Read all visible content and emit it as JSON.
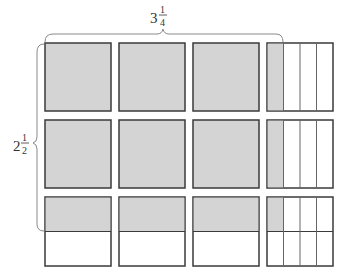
{
  "diagram": {
    "type": "area-model",
    "width_label": {
      "whole": "3",
      "numerator": "1",
      "denominator": "4"
    },
    "height_label": {
      "whole": "2",
      "numerator": "1",
      "denominator": "2"
    },
    "colors": {
      "shaded": "#d4d4d4",
      "unshaded": "#ffffff",
      "border": "#3a3a3a",
      "brace": "#8a8a8a"
    },
    "grid": {
      "columns": 4,
      "rows": 3,
      "column_x": [
        45,
        119,
        193,
        267
      ],
      "row_y": [
        43,
        120,
        197
      ],
      "cell_size": 66,
      "last_column_subdivisions": 4,
      "last_row_subdivisions": 2,
      "last_column_shaded_fraction": "1/4",
      "last_row_shaded_fraction": "1/2"
    }
  }
}
